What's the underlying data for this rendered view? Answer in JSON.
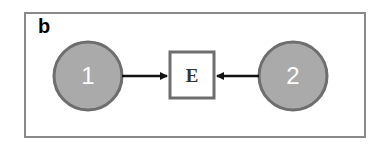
{
  "panel": {
    "label": "b"
  },
  "nodes": [
    {
      "id": "1",
      "label": "1",
      "shape": "circle",
      "fill": "#aaaaaa",
      "stroke": "#6e6e6e"
    },
    {
      "id": "2",
      "label": "2",
      "shape": "circle",
      "fill": "#aaaaaa",
      "stroke": "#6e6e6e"
    },
    {
      "id": "E",
      "label": "E",
      "shape": "square",
      "fill": "#ffffff",
      "stroke": "#6e6e6e"
    }
  ],
  "edges": [
    {
      "from": "1",
      "to": "E"
    },
    {
      "from": "2",
      "to": "E"
    }
  ]
}
